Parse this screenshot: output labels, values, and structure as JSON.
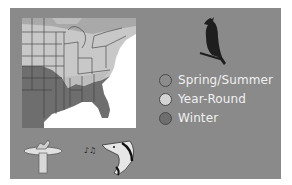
{
  "map": {
    "region": "Eastern United States range map",
    "colors": {
      "spring_summer": "#a9a9a9",
      "year_round": "#c8c8c8",
      "winter": "#6e6e6e",
      "background": "#8a8a8a",
      "water": "#ffffff"
    }
  },
  "legend": {
    "items": [
      {
        "label": "Spring/Summer",
        "color": "#8c8c8c"
      },
      {
        "label": "Year-Round",
        "color": "#d4d4d4"
      },
      {
        "label": "Winter",
        "color": "#6e6e6e"
      }
    ]
  },
  "icons": {
    "bird": "bird-silhouette-icon",
    "feeder": "bird-bath-icon",
    "song": "bird-song-icon"
  }
}
